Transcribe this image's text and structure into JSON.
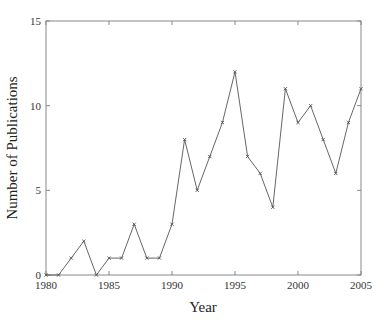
{
  "chart_data": {
    "type": "line",
    "title": "",
    "xlabel": "Year",
    "ylabel": "Number of Publications",
    "xlim": [
      1980,
      2005
    ],
    "ylim": [
      0,
      15
    ],
    "grid": false,
    "legend": null,
    "x_ticks": [
      1980,
      1985,
      1990,
      1995,
      2000,
      2005
    ],
    "y_ticks": [
      0,
      5,
      10,
      15
    ],
    "x_tick_labels": [
      "1980",
      "1985",
      "1990",
      "1995",
      "2000",
      "2005"
    ],
    "y_tick_labels": [
      "0",
      "5",
      "10",
      "15"
    ],
    "series": [
      {
        "name": "Publications",
        "marker": "x",
        "color": "#555555",
        "x": [
          1980,
          1981,
          1982,
          1983,
          1984,
          1985,
          1986,
          1987,
          1988,
          1989,
          1990,
          1991,
          1992,
          1993,
          1994,
          1995,
          1996,
          1997,
          1998,
          1999,
          2000,
          2001,
          2002,
          2003,
          2004,
          2005
        ],
        "values": [
          0,
          0,
          1,
          2,
          0,
          1,
          1,
          3,
          1,
          1,
          3,
          8,
          5,
          7,
          9,
          12,
          7,
          6,
          4,
          11,
          9,
          10,
          8,
          6,
          9,
          11
        ]
      }
    ]
  },
  "colors": {
    "axis": "#888888",
    "line": "#555555"
  }
}
